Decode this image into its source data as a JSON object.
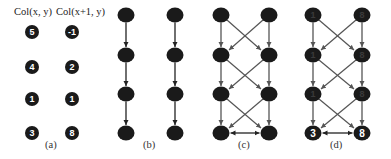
{
  "panels": [
    {
      "id": "a",
      "caption": "(a)",
      "column_headers": [
        "Col(x, y)",
        "Col(x+1, y)"
      ],
      "left_values": [
        "5",
        "4",
        "1",
        "3"
      ],
      "right_values": [
        "-1",
        "2",
        "1",
        "8"
      ],
      "edges": "none"
    },
    {
      "id": "b",
      "caption": "(b)",
      "edges": "vertical"
    },
    {
      "id": "c",
      "caption": "(c)",
      "edges": "vertical+cross+bottom-bidirectional"
    },
    {
      "id": "d",
      "caption": "(d)",
      "left_values": [
        "1",
        "1",
        "1",
        "3"
      ],
      "right_values": [
        "8",
        "8",
        "8",
        "8"
      ],
      "highlight_bottom": true,
      "edges": "vertical+cross+bottom-bidirectional"
    }
  ],
  "colors": {
    "node": "#1a1a1a",
    "edge_dark": "#222222",
    "edge_gray": "#5a5a5a"
  }
}
